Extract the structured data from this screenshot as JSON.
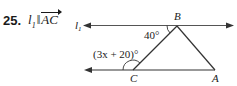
{
  "problem": {
    "number": "25.",
    "line_name": "l",
    "line_subscript": "1",
    "parallel_symbol": "‖",
    "segment": "AC"
  },
  "diagram": {
    "line_label": "l",
    "line_label_subscript": "1",
    "vertices": {
      "A": "A",
      "B": "B",
      "C": "C"
    },
    "angle_at_B": "40°",
    "angle_at_C": "(3x + 20)°",
    "stroke_color": "#333333"
  }
}
